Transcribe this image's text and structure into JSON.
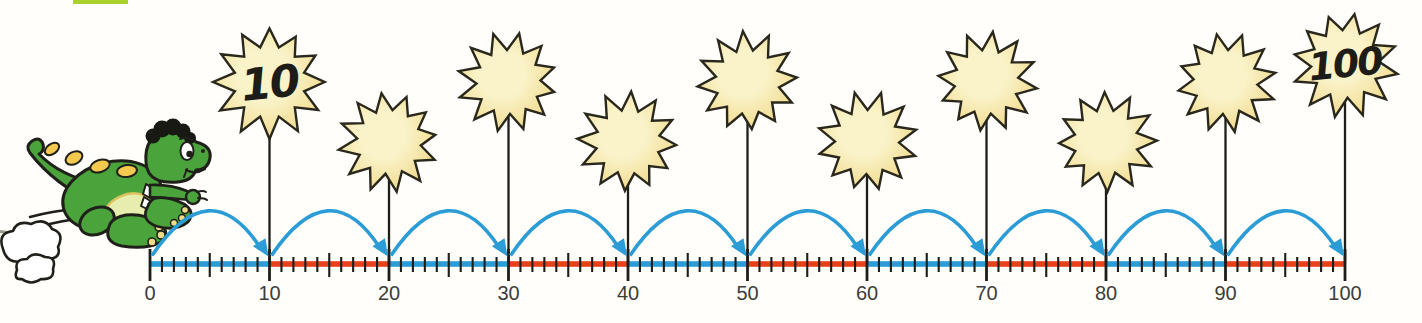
{
  "palette": {
    "tab_green": "#a8d22b",
    "segment_blue": "#2b9cd5",
    "segment_red": "#e84119",
    "arc_blue": "#2b9cd5",
    "tick_black": "#1d1d19",
    "label_gray": "#3c3c39",
    "sun_center": "#faf3ca",
    "sun_edge": "#efd57f",
    "sun_outline": "#2a281c",
    "sun_number": "#1d1c17",
    "outline": "#20201a",
    "dragon_green": "#4ba33c",
    "belly": "#e7edaf",
    "belly_line": "#d9c35f",
    "spot_yellow": "#f3c94f",
    "nail_yellow": "#f0dc86",
    "hair_black": "#191914",
    "white": "#ffffff",
    "motion_gray": "#9a9a90"
  },
  "illustration": {
    "dragon_icon": "running-green-dragon",
    "dust_cloud_icon": "dust-cloud",
    "page_tab_icon": "page-corner-tab"
  },
  "chart_data": {
    "type": "number-line",
    "title": "",
    "min": 0,
    "max": 100,
    "minor_tick_step": 1,
    "mid_tick_step": 5,
    "major_tick_step": 10,
    "major_tick_labels": [
      "0",
      "10",
      "20",
      "30",
      "40",
      "50",
      "60",
      "70",
      "80",
      "90",
      "100"
    ],
    "segments": [
      {
        "from": 0,
        "to": 10,
        "color": "blue"
      },
      {
        "from": 10,
        "to": 20,
        "color": "red"
      },
      {
        "from": 20,
        "to": 30,
        "color": "blue"
      },
      {
        "from": 30,
        "to": 40,
        "color": "red"
      },
      {
        "from": 40,
        "to": 50,
        "color": "blue"
      },
      {
        "from": 50,
        "to": 60,
        "color": "red"
      },
      {
        "from": 60,
        "to": 70,
        "color": "blue"
      },
      {
        "from": 70,
        "to": 80,
        "color": "red"
      },
      {
        "from": 80,
        "to": 90,
        "color": "blue"
      },
      {
        "from": 90,
        "to": 100,
        "color": "red"
      }
    ],
    "jumps": [
      {
        "from": 0,
        "to": 10
      },
      {
        "from": 10,
        "to": 20
      },
      {
        "from": 20,
        "to": 30
      },
      {
        "from": 30,
        "to": 40
      },
      {
        "from": 40,
        "to": 50
      },
      {
        "from": 50,
        "to": 60
      },
      {
        "from": 60,
        "to": 70
      },
      {
        "from": 70,
        "to": 80
      },
      {
        "from": 80,
        "to": 90
      },
      {
        "from": 90,
        "to": 100
      }
    ],
    "suns": [
      {
        "at": 10,
        "label": "10",
        "size": "tall"
      },
      {
        "at": 20,
        "label": "",
        "size": "short"
      },
      {
        "at": 30,
        "label": "",
        "size": "tall"
      },
      {
        "at": 40,
        "label": "",
        "size": "short"
      },
      {
        "at": 50,
        "label": "",
        "size": "tall"
      },
      {
        "at": 60,
        "label": "",
        "size": "short"
      },
      {
        "at": 70,
        "label": "",
        "size": "tall"
      },
      {
        "at": 80,
        "label": "",
        "size": "short"
      },
      {
        "at": 90,
        "label": "",
        "size": "tall"
      },
      {
        "at": 100,
        "label": "100",
        "size": "tall"
      }
    ]
  }
}
